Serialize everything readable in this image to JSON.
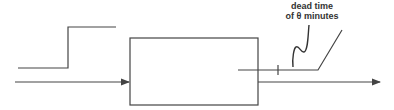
{
  "diagram": {
    "annotation": {
      "line1": "dead time",
      "line2": "of θ minutes"
    },
    "colors": {
      "stroke": "#444444",
      "background": "#ffffff"
    }
  }
}
